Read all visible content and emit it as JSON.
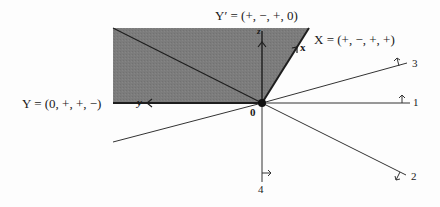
{
  "diagram": {
    "type": "cone-fan",
    "colors": {
      "shade": "#7a7a7a",
      "line": "#222222",
      "background": "#fdfdfd"
    },
    "origin_label": "0",
    "labels": {
      "Y": "Y = (0, +, +, −)",
      "Y_prime": "Y′ = (+, −, +, 0)",
      "X": "X = (+, −, +, +)"
    },
    "axes": {
      "x": "x",
      "y": "y",
      "z": "z"
    },
    "rays": [
      {
        "id": "1",
        "label": "1"
      },
      {
        "id": "2",
        "label": "2"
      },
      {
        "id": "3",
        "label": "3"
      },
      {
        "id": "4",
        "label": "4"
      }
    ]
  }
}
